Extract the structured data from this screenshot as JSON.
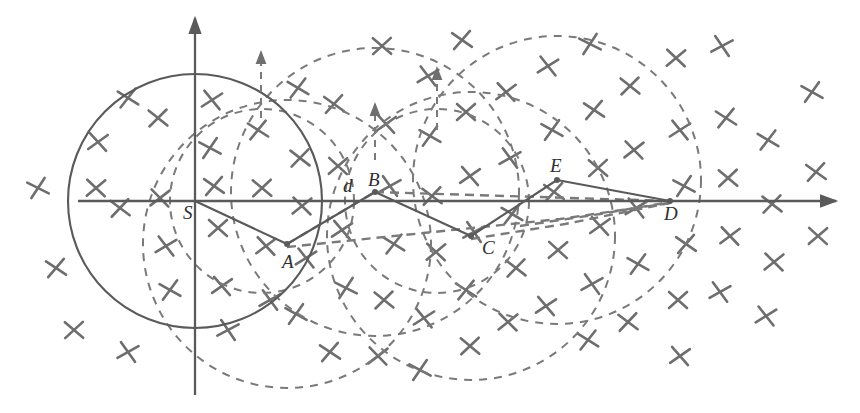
{
  "figure": {
    "background": "#ffffff",
    "stroke_solid": "#5a5a5a",
    "stroke_dashed": "#7a7a7a",
    "cross_color": "#6e6e6e",
    "label_color": "#2f2f2f",
    "width": 860,
    "height": 413
  },
  "axes": {
    "origin": {
      "x": 195,
      "y": 201,
      "label": "S"
    },
    "x_axis": {
      "x1": 78,
      "y1": 201,
      "x2": 836,
      "y2": 201,
      "arrow": "right",
      "arrow_label": "x-axis-arrow"
    },
    "y_axis": {
      "x1": 195,
      "y1": 395,
      "x2": 195,
      "y2": 18,
      "arrow": "up",
      "arrow_label": "y-axis-arrow"
    }
  },
  "nodes": [
    {
      "id": "S",
      "label": "S",
      "x": 195,
      "y": 201,
      "label_x": 183,
      "label_y": 219
    },
    {
      "id": "A",
      "label": "A",
      "x": 287,
      "y": 244,
      "label_x": 282,
      "label_y": 268
    },
    {
      "id": "B",
      "label": "B",
      "x": 375,
      "y": 192,
      "label_x": 368,
      "label_y": 186
    },
    {
      "id": "C",
      "label": "C",
      "x": 471,
      "y": 236,
      "label_x": 482,
      "label_y": 254
    },
    {
      "id": "E",
      "label": "E",
      "x": 557,
      "y": 180,
      "label_x": 550,
      "label_y": 172
    },
    {
      "id": "D",
      "label": "D",
      "x": 670,
      "y": 201,
      "label_x": 664,
      "label_y": 220
    }
  ],
  "distance_label": {
    "text": "d",
    "x": 343,
    "y": 192
  },
  "path": {
    "name": "solid-route",
    "sequence": [
      "S",
      "A",
      "B",
      "C",
      "E",
      "D"
    ],
    "points": [
      [
        195,
        201
      ],
      [
        287,
        244
      ],
      [
        375,
        192
      ],
      [
        471,
        236
      ],
      [
        557,
        180
      ],
      [
        670,
        201
      ]
    ]
  },
  "solid_circle": {
    "cx": 195,
    "cy": 201,
    "r": 127,
    "name": "sensing-circle-S"
  },
  "dashed_circles": [
    {
      "name": "dashed-circle-A",
      "cx": 287,
      "cy": 244,
      "r": 144
    },
    {
      "name": "dashed-circle-B",
      "cx": 375,
      "cy": 192,
      "r": 144
    },
    {
      "name": "dashed-circle-C",
      "cx": 471,
      "cy": 236,
      "r": 144
    },
    {
      "name": "dashed-circle-E",
      "cx": 557,
      "cy": 180,
      "r": 144
    },
    {
      "name": "dashed-circle-near-S",
      "cx": 262,
      "cy": 201,
      "r": 92
    },
    {
      "name": "dashed-circle-mid",
      "cx": 437,
      "cy": 201,
      "r": 92
    }
  ],
  "dashed_arrows": [
    {
      "name": "dashed-arrow-1",
      "x": 261,
      "y_from": 118,
      "y_to": 52
    },
    {
      "name": "dashed-arrow-2",
      "x": 375,
      "y_from": 160,
      "y_to": 104
    },
    {
      "name": "dashed-arrow-3",
      "x": 437,
      "y_from": 130,
      "y_to": 68
    }
  ],
  "dashed_links": [
    {
      "name": "dashed-link-A-B",
      "points": [
        [
          287,
          244
        ],
        [
          375,
          192
        ]
      ]
    },
    {
      "name": "dashed-link-B-D",
      "points": [
        [
          375,
          192
        ],
        [
          670,
          201
        ]
      ]
    },
    {
      "name": "dashed-link-A-D",
      "points": [
        [
          287,
          247
        ],
        [
          560,
          219
        ],
        [
          670,
          203
        ]
      ]
    },
    {
      "name": "dashed-link-C-D",
      "points": [
        [
          471,
          239
        ],
        [
          565,
          224
        ],
        [
          670,
          203
        ]
      ]
    },
    {
      "name": "dashed-link-E-D",
      "points": [
        [
          520,
          226
        ],
        [
          600,
          214
        ],
        [
          670,
          202
        ]
      ]
    }
  ],
  "crosses": {
    "name": "obstacle-marks",
    "glyph": "x",
    "count": 74,
    "points": [
      [
        38,
        188
      ],
      [
        56,
        268
      ],
      [
        74,
        330
      ],
      [
        98,
        142
      ],
      [
        128,
        352
      ],
      [
        128,
        98
      ],
      [
        158,
        118
      ],
      [
        160,
        198
      ],
      [
        166,
        246
      ],
      [
        170,
        290
      ],
      [
        120,
        208
      ],
      [
        96,
        188
      ],
      [
        212,
        100
      ],
      [
        210,
        148
      ],
      [
        214,
        186
      ],
      [
        218,
        228
      ],
      [
        222,
        286
      ],
      [
        228,
        330
      ],
      [
        258,
        130
      ],
      [
        262,
        188
      ],
      [
        266,
        246
      ],
      [
        270,
        300
      ],
      [
        298,
        88
      ],
      [
        300,
        158
      ],
      [
        302,
        206
      ],
      [
        306,
        258
      ],
      [
        296,
        314
      ],
      [
        334,
        104
      ],
      [
        338,
        166
      ],
      [
        342,
        230
      ],
      [
        346,
        288
      ],
      [
        330,
        352
      ],
      [
        382,
        46
      ],
      [
        386,
        124
      ],
      [
        390,
        186
      ],
      [
        394,
        244
      ],
      [
        384,
        300
      ],
      [
        378,
        356
      ],
      [
        428,
        76
      ],
      [
        430,
        136
      ],
      [
        432,
        196
      ],
      [
        436,
        252
      ],
      [
        424,
        318
      ],
      [
        420,
        370
      ],
      [
        462,
        40
      ],
      [
        466,
        112
      ],
      [
        470,
        176
      ],
      [
        474,
        232
      ],
      [
        466,
        290
      ],
      [
        470,
        346
      ],
      [
        506,
        92
      ],
      [
        510,
        158
      ],
      [
        512,
        214
      ],
      [
        516,
        268
      ],
      [
        508,
        322
      ],
      [
        548,
        66
      ],
      [
        552,
        130
      ],
      [
        554,
        192
      ],
      [
        558,
        250
      ],
      [
        546,
        306
      ],
      [
        590,
        44
      ],
      [
        594,
        110
      ],
      [
        598,
        168
      ],
      [
        600,
        226
      ],
      [
        592,
        284
      ],
      [
        588,
        340
      ],
      [
        630,
        86
      ],
      [
        634,
        150
      ],
      [
        636,
        208
      ],
      [
        638,
        264
      ],
      [
        628,
        322
      ],
      [
        676,
        58
      ],
      [
        680,
        130
      ],
      [
        684,
        186
      ],
      [
        686,
        244
      ],
      [
        678,
        300
      ],
      [
        680,
        356
      ],
      [
        722,
        46
      ],
      [
        726,
        118
      ],
      [
        728,
        178
      ],
      [
        730,
        236
      ],
      [
        720,
        292
      ],
      [
        768,
        140
      ],
      [
        772,
        204
      ],
      [
        774,
        262
      ],
      [
        766,
        316
      ],
      [
        812,
        92
      ],
      [
        816,
        172
      ],
      [
        818,
        236
      ]
    ]
  }
}
